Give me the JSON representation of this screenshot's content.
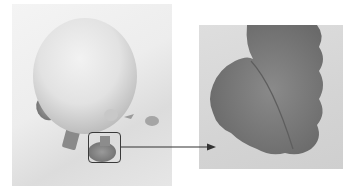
{
  "figure": {
    "main_photo": {
      "subject": "round-fruit-with-leaves",
      "tone": "grayscale"
    },
    "highlight_box": {
      "target": "leaf-region"
    },
    "magnified_inset": {
      "subject": "leaf-closeup"
    },
    "arrow": {
      "direction": "right",
      "from": "highlight-box",
      "to": "magnified-inset"
    }
  },
  "colors": {
    "outline": "#3a3a3a",
    "fruit_light": "#eeeeee",
    "fruit_shadow": "#bdbdbd",
    "leaf_dark": "#7a7a7a",
    "leaf_mid": "#8e8e8e",
    "background": "#ffffff"
  }
}
